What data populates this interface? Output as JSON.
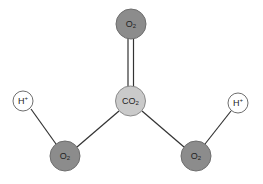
{
  "colors": {
    "oxygen_fill": "#8c8c8c",
    "carbon_fill": "#cacaca",
    "hydrogen_fill": "#ffffff",
    "stroke": "#6e6e6e",
    "bond": "#333333"
  },
  "atoms": [
    {
      "id": "o-top",
      "base": "O",
      "sub": "2",
      "sup": "",
      "type": "oxygen"
    },
    {
      "id": "co2-center",
      "base": "CO",
      "sub": "2",
      "sup": "",
      "type": "carbon"
    },
    {
      "id": "h-left",
      "base": "H",
      "sub": "",
      "sup": "+",
      "type": "hydrogen"
    },
    {
      "id": "h-right",
      "base": "H",
      "sub": "",
      "sup": "+",
      "type": "hydrogen"
    },
    {
      "id": "o-bottom-left",
      "base": "O",
      "sub": "2",
      "sup": "",
      "type": "oxygen"
    },
    {
      "id": "o-bottom-right",
      "base": "O",
      "sub": "2",
      "sup": "",
      "type": "oxygen"
    }
  ],
  "bonds": [
    {
      "from": "co2-center",
      "to": "o-top",
      "order": "double"
    },
    {
      "from": "co2-center",
      "to": "o-bottom-left",
      "order": "single"
    },
    {
      "from": "co2-center",
      "to": "o-bottom-right",
      "order": "single"
    },
    {
      "from": "o-bottom-left",
      "to": "h-left",
      "order": "single"
    },
    {
      "from": "o-bottom-right",
      "to": "h-right",
      "order": "single"
    }
  ]
}
